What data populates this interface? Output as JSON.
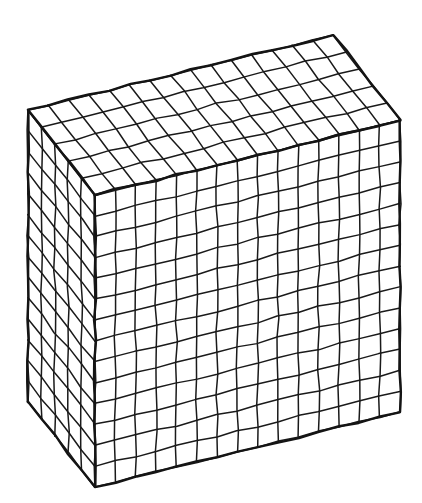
{
  "figure": {
    "title": "Isometric grid cuboid line drawing",
    "style": "black-and-white line art, hand-drawn wobbly strokes, no shading, white background",
    "background_color": "#ffffff",
    "line_color": "#1a1a1a",
    "edge_color": "#141414"
  },
  "geometry": {
    "projection": "oblique-isometric",
    "grid_counts": {
      "width_cells": 15,
      "height_cells": 14,
      "depth_cells": 5
    },
    "vertices": {
      "front_bottom_left": [
        95,
        487
      ],
      "front_bottom_right": [
        400,
        412
      ],
      "front_top_right": [
        400,
        120
      ],
      "front_top_left": [
        95,
        195
      ],
      "back_top_left": [
        28,
        110
      ],
      "back_top_right": [
        333,
        18
      ],
      "back_bottom_left": [
        28,
        402
      ]
    },
    "depth_offset": [
      -67,
      -85
    ],
    "stroke_widths": {
      "grid": 1.5,
      "edge": 2.4
    },
    "wobble_amplitude": 1.1
  },
  "faces": [
    {
      "name": "front-face",
      "label": "Front face",
      "cols": 15,
      "rows": 14,
      "cell_count": 210,
      "visible": true
    },
    {
      "name": "top-face",
      "label": "Top face",
      "cols": 15,
      "rows": 5,
      "cell_count": 75,
      "visible": true
    },
    {
      "name": "left-face",
      "label": "Left side face",
      "cols": 5,
      "rows": 14,
      "cell_count": 70,
      "visible": true
    }
  ]
}
